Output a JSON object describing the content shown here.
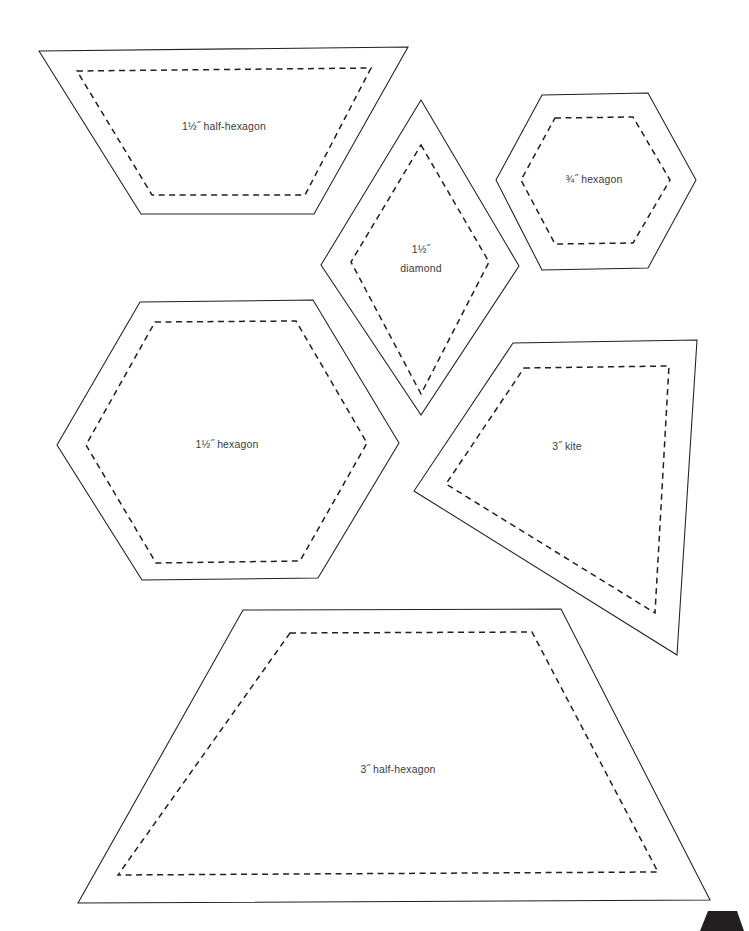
{
  "page": {
    "background_color": "#ffffff",
    "line_color": "#231f20",
    "label_color": "#3b3b3d",
    "width": 749,
    "height": 931
  },
  "shapes": [
    {
      "id": "half-hexagon-1-5",
      "name": "1½″ half-hexagon",
      "label": "1½˝ half-hexagon",
      "label_line2": "",
      "type": "trapezoid",
      "cut_points": "39,51 408,47 314,214 141,214",
      "seam_points": "77,71 371,68 305,195 152,195",
      "label_x": 224,
      "label_y": 127
    },
    {
      "id": "diamond-1-5",
      "name": "1½″ diamond",
      "label": "1½˝",
      "label_line2": "diamond",
      "type": "diamond",
      "cut_points": "421,100 519,266 421,415 321,265",
      "seam_points": "421,145 489,262 421,394 351,262",
      "label_x": 421,
      "label_y": 250
    },
    {
      "id": "hexagon-0-75",
      "name": "¾″ hexagon",
      "label": "¾˝ hexagon",
      "label_line2": "",
      "type": "hexagon",
      "cut_points": "542,95 648,93 696,180 648,268 542,270 496,180",
      "seam_points": "555,118 633,117 670,180 633,243 555,244 521,180",
      "label_x": 594,
      "label_y": 180
    },
    {
      "id": "hexagon-1-5",
      "name": "1½″ hexagon",
      "label": "1½˝ hexagon",
      "label_line2": "",
      "type": "hexagon",
      "cut_points": "140,302 313,300 399,443 318,578 142,580 57,445",
      "seam_points": "155,322 296,321 367,443 300,561 156,563 86,445",
      "label_x": 227,
      "label_y": 445
    },
    {
      "id": "kite-3",
      "name": "3″ kite",
      "label": "3˝ kite",
      "label_line2": "",
      "type": "kite",
      "cut_points": "513,343 697,340 677,655 414,491",
      "seam_points": "524,368 669,366 655,613 446,484",
      "label_x": 567,
      "label_y": 447
    },
    {
      "id": "half-hexagon-3",
      "name": "3″ half-hexagon",
      "label": "3˝ half-hexagon",
      "label_line2": "",
      "type": "trapezoid",
      "cut_points": "243,610 561,609 710,900 78,903",
      "seam_points": "290,633 532,632 658,872 118,875",
      "label_x": 398,
      "label_y": 770
    }
  ],
  "corner_mark": {
    "name": "page-corner-mark",
    "points": "700,931 744,931 737,911 708,911"
  }
}
